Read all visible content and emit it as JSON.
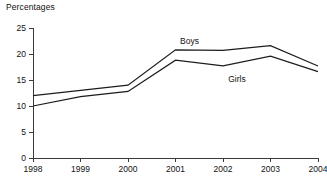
{
  "chart_data": {
    "type": "line",
    "title": "Percentages",
    "xlabel": "",
    "ylabel": "Percentages",
    "x": [
      "1998",
      "1999",
      "2000",
      "2001",
      "2002",
      "2003",
      "2004"
    ],
    "categories": [
      "1998",
      "1999",
      "2000",
      "2001",
      "2002",
      "2003",
      "2004"
    ],
    "series": [
      {
        "name": "Boys",
        "values": [
          12.0,
          13.0,
          14.0,
          20.8,
          20.7,
          21.6,
          17.7
        ]
      },
      {
        "name": "Girls",
        "values": [
          10.0,
          11.8,
          12.8,
          18.8,
          17.7,
          19.6,
          16.6
        ]
      }
    ],
    "ylim": [
      0,
      25
    ],
    "yticks": [
      0,
      5,
      10,
      15,
      20,
      25
    ],
    "ytick_labels": [
      "0",
      "5",
      "10",
      "15",
      "20",
      "25"
    ],
    "xtick_labels": [
      "1998",
      "1999",
      "2000",
      "2001",
      "2002",
      "2003",
      "2004"
    ],
    "grid": false,
    "legend": "inline-annotations",
    "annotations": [
      {
        "text": "Boys",
        "series": "Boys",
        "near_x": "2001"
      },
      {
        "text": "Girls",
        "series": "Girls",
        "near_x": "2002"
      }
    ],
    "colors": {
      "line": "#1c1c1c",
      "axis": "#3a3a3a",
      "text": "#111111",
      "background": "#ffffff"
    }
  }
}
